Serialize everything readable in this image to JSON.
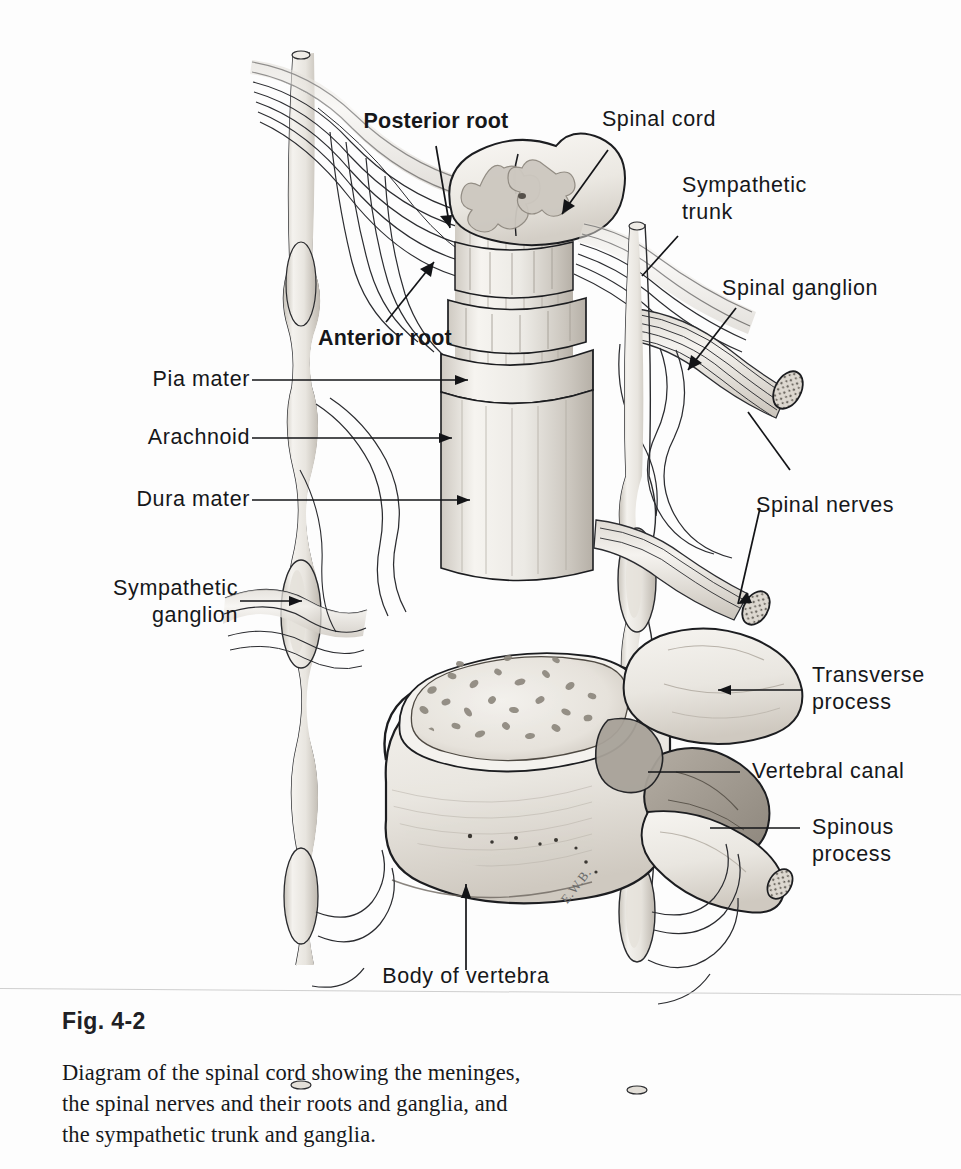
{
  "figure": {
    "number": "Fig. 4-2",
    "caption": "Diagram of the spinal cord showing the meninges,\nthe spinal nerves and their roots and ganglia, and\nthe sympathetic trunk and ganglia.",
    "artist_signature": "E.W.B."
  },
  "labels": {
    "posterior_root": "Posterior root",
    "spinal_cord": "Spinal cord",
    "sympathetic_trunk": "Sympathetic\ntrunk",
    "sympathetic_trunk_line1": "Sympathetic",
    "sympathetic_trunk_line2": "trunk",
    "spinal_ganglion": "Spinal ganglion",
    "anterior_root": "Anterior root",
    "pia_mater": "Pia mater",
    "arachnoid": "Arachnoid",
    "dura_mater": "Dura mater",
    "sympathetic_ganglion_line1": "Sympathetic",
    "sympathetic_ganglion_line2": "ganglion",
    "spinal_nerves": "Spinal nerves",
    "transverse_process_line1": "Transverse",
    "transverse_process_line2": "process",
    "vertebral_canal": "Vertebral canal",
    "spinous_process_line1": "Spinous",
    "spinous_process_line2": "process",
    "body_of_vertebra": "Body of vertebra"
  },
  "colors": {
    "ink": "#16171a",
    "line": "#1b1c1f",
    "page": "#fdfdfd",
    "rule": "#cfcfcf",
    "tissue_light": "#f2f0ec",
    "tissue_mid": "#ddd9d2",
    "tissue_shade": "#c2bdb5",
    "bone_dark": "#9c968d",
    "cord_fill": "#efece6",
    "gray_matter": "#cdc8c0"
  }
}
